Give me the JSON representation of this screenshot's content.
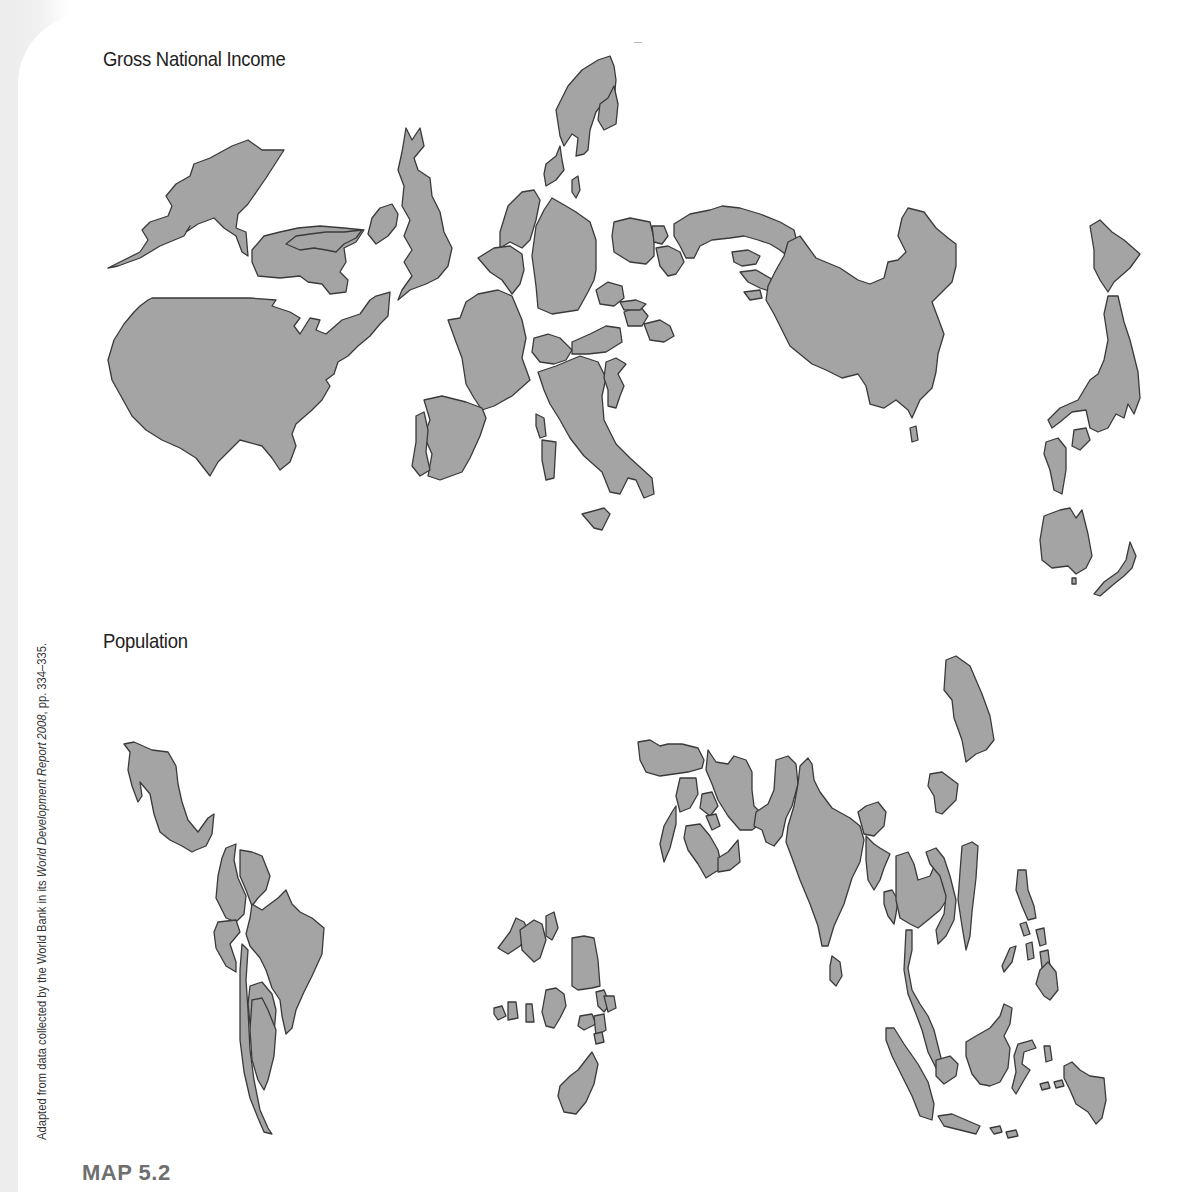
{
  "figure": {
    "label": "MAP 5.2",
    "credit_prefix": "Adapted from data collected by the World Bank in its ",
    "credit_source": "World Development Report 2008",
    "credit_suffix": ", pp. 334–335."
  },
  "maps": [
    {
      "title": "Gross National Income",
      "type": "cartogram",
      "regions_depicted": [
        "Alaska",
        "Canada",
        "United States",
        "Ireland",
        "United Kingdom",
        "Norway",
        "Sweden",
        "Finland",
        "Denmark",
        "Netherlands",
        "Belgium",
        "Germany",
        "France",
        "Spain",
        "Portugal",
        "Switzerland",
        "Austria",
        "Italy",
        "Greece",
        "Poland",
        "Czech Republic",
        "Hungary",
        "Romania",
        "Russia",
        "Kazakhstan",
        "China",
        "Japan",
        "South Korea",
        "Australia",
        "New Zealand"
      ]
    },
    {
      "title": "Population",
      "type": "cartogram",
      "regions_depicted": [
        "Mexico",
        "Colombia",
        "Venezuela",
        "Peru",
        "Brazil",
        "Bolivia",
        "Chile",
        "Argentina",
        "Nigeria",
        "Ethiopia",
        "Egypt",
        "Congo DR",
        "South Africa",
        "Turkey",
        "Iran",
        "Saudi Arabia",
        "Pakistan",
        "India",
        "Sri Lanka",
        "Bangladesh",
        "Myanmar",
        "Thailand",
        "Vietnam",
        "Philippines",
        "Malaysia",
        "Indonesia",
        "South Korea",
        "North Korea",
        "Taiwan"
      ]
    }
  ],
  "style": {
    "land_fill": "#a4a4a4",
    "land_stroke": "#3a3a3a",
    "background": "#ffffff",
    "label_gray": "#6f6f6f"
  }
}
